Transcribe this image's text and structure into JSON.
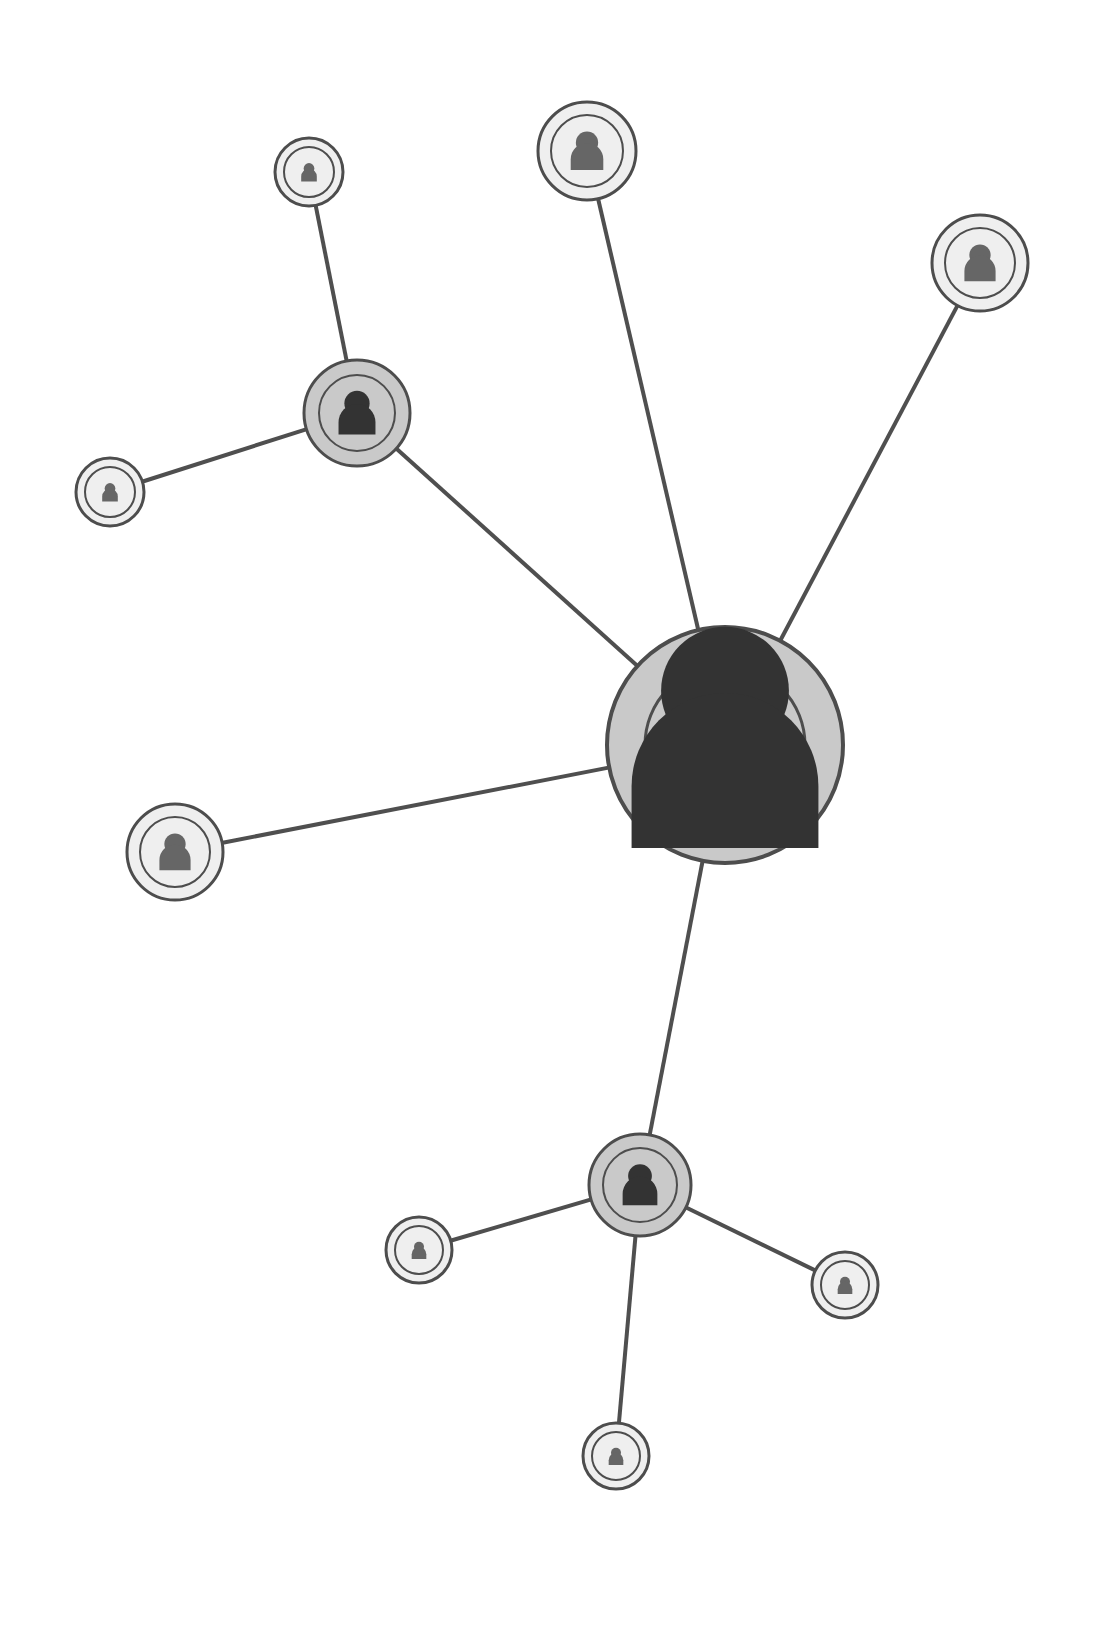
{
  "diagram": {
    "type": "node-link-network",
    "background_color": "#ffffff",
    "canvas": {
      "width": 1119,
      "height": 1627
    },
    "node_icon_name": "person-avatar-icon",
    "styles": {
      "hub_fill": "#c9c9c9",
      "hub_icon_color": "#333333",
      "leaf_fill": "#efefef",
      "leaf_icon_color": "#666666",
      "node_stroke": "#4d4d4d",
      "inner_ring_stroke": "#4d4d4d",
      "edge_color": "#4f4f4f",
      "edge_width": 4
    },
    "counts": {
      "total_nodes": 11,
      "total_edges": 10,
      "hub_nodes": 3,
      "leaf_nodes": 8
    },
    "nodes": [
      {
        "id": "center-hub",
        "label": "Central User",
        "role": "primary-hub",
        "cx": 725,
        "cy": 745,
        "r_outer": 118,
        "r_inner": 80,
        "icon_scale": 1.0,
        "fill": "#c9c9c9",
        "icon_color": "#333333",
        "stroke": "#4d4d4d",
        "stroke_width": 4,
        "degree": 5
      },
      {
        "id": "upper-left-hub",
        "label": "Upper Left Group Leader",
        "role": "secondary-hub",
        "cx": 357,
        "cy": 413,
        "r_outer": 53,
        "r_inner": 38,
        "icon_scale": 0.44,
        "fill": "#c9c9c9",
        "icon_color": "#333333",
        "stroke": "#4d4d4d",
        "stroke_width": 3,
        "degree": 3
      },
      {
        "id": "bottom-hub",
        "label": "Lower Group Leader",
        "role": "secondary-hub",
        "cx": 640,
        "cy": 1185,
        "r_outer": 51,
        "r_inner": 37,
        "icon_scale": 0.43,
        "fill": "#c9c9c9",
        "icon_color": "#333333",
        "stroke": "#4d4d4d",
        "stroke_width": 3,
        "degree": 4
      },
      {
        "id": "top-center-node",
        "label": "Top Center Contact",
        "role": "leaf",
        "cx": 587,
        "cy": 151,
        "r_outer": 49,
        "r_inner": 36,
        "icon_scale": 0.42,
        "fill": "#efefef",
        "icon_color": "#666666",
        "stroke": "#4d4d4d",
        "stroke_width": 3,
        "degree": 1
      },
      {
        "id": "top-right-node",
        "label": "Top Right Contact",
        "role": "leaf",
        "cx": 980,
        "cy": 263,
        "r_outer": 48,
        "r_inner": 35,
        "icon_scale": 0.41,
        "fill": "#efefef",
        "icon_color": "#666666",
        "stroke": "#4d4d4d",
        "stroke_width": 3,
        "degree": 1
      },
      {
        "id": "left-mid-node",
        "label": "Left Middle Contact",
        "role": "leaf",
        "cx": 175,
        "cy": 852,
        "r_outer": 48,
        "r_inner": 35,
        "icon_scale": 0.41,
        "fill": "#efefef",
        "icon_color": "#666666",
        "stroke": "#4d4d4d",
        "stroke_width": 3,
        "degree": 1
      },
      {
        "id": "small-top-left-node",
        "label": "Upper Left Small Contact",
        "role": "leaf",
        "cx": 309,
        "cy": 172,
        "r_outer": 34,
        "r_inner": 25,
        "icon_scale": 0.29,
        "fill": "#efefef",
        "icon_color": "#666666",
        "stroke": "#4d4d4d",
        "stroke_width": 3,
        "degree": 1
      },
      {
        "id": "small-far-left-node",
        "label": "Far Left Small Contact",
        "role": "leaf",
        "cx": 110,
        "cy": 492,
        "r_outer": 34,
        "r_inner": 25,
        "icon_scale": 0.29,
        "fill": "#efefef",
        "icon_color": "#666666",
        "stroke": "#4d4d4d",
        "stroke_width": 3,
        "degree": 1
      },
      {
        "id": "small-bottom-left-node",
        "label": "Lower Left Small Contact",
        "role": "leaf",
        "cx": 419,
        "cy": 1250,
        "r_outer": 33,
        "r_inner": 24,
        "icon_scale": 0.28,
        "fill": "#efefef",
        "icon_color": "#666666",
        "stroke": "#4d4d4d",
        "stroke_width": 3,
        "degree": 1
      },
      {
        "id": "small-bottom-right-node",
        "label": "Lower Right Small Contact",
        "role": "leaf",
        "cx": 845,
        "cy": 1285,
        "r_outer": 33,
        "r_inner": 24,
        "icon_scale": 0.28,
        "fill": "#efefef",
        "icon_color": "#666666",
        "stroke": "#4d4d4d",
        "stroke_width": 3,
        "degree": 1
      },
      {
        "id": "small-bottom-node",
        "label": "Bottom Small Contact",
        "role": "leaf",
        "cx": 616,
        "cy": 1456,
        "r_outer": 33,
        "r_inner": 24,
        "icon_scale": 0.28,
        "fill": "#efefef",
        "icon_color": "#666666",
        "stroke": "#4d4d4d",
        "stroke_width": 3,
        "degree": 1
      }
    ],
    "edges": [
      {
        "id": "edge-center-upperleft",
        "from": "center-hub",
        "to": "upper-left-hub",
        "x1": 725,
        "y1": 745,
        "x2": 357,
        "y2": 413
      },
      {
        "id": "edge-center-topcenter",
        "from": "center-hub",
        "to": "top-center-node",
        "x1": 725,
        "y1": 745,
        "x2": 587,
        "y2": 151
      },
      {
        "id": "edge-center-topright",
        "from": "center-hub",
        "to": "top-right-node",
        "x1": 725,
        "y1": 745,
        "x2": 980,
        "y2": 263
      },
      {
        "id": "edge-center-leftmid",
        "from": "center-hub",
        "to": "left-mid-node",
        "x1": 725,
        "y1": 745,
        "x2": 175,
        "y2": 852
      },
      {
        "id": "edge-center-bottomhub",
        "from": "center-hub",
        "to": "bottom-hub",
        "x1": 725,
        "y1": 745,
        "x2": 640,
        "y2": 1185
      },
      {
        "id": "edge-upperleft-smalltop",
        "from": "upper-left-hub",
        "to": "small-top-left-node",
        "x1": 357,
        "y1": 413,
        "x2": 309,
        "y2": 172
      },
      {
        "id": "edge-upperleft-farleft",
        "from": "upper-left-hub",
        "to": "small-far-left-node",
        "x1": 357,
        "y1": 413,
        "x2": 110,
        "y2": 492
      },
      {
        "id": "edge-bottomhub-bottomleft",
        "from": "bottom-hub",
        "to": "small-bottom-left-node",
        "x1": 640,
        "y1": 1185,
        "x2": 419,
        "y2": 1250
      },
      {
        "id": "edge-bottomhub-bottomright",
        "from": "bottom-hub",
        "to": "small-bottom-right-node",
        "x1": 640,
        "y1": 1185,
        "x2": 845,
        "y2": 1285
      },
      {
        "id": "edge-bottomhub-bottom",
        "from": "bottom-hub",
        "to": "small-bottom-node",
        "x1": 640,
        "y1": 1185,
        "x2": 616,
        "y2": 1456
      }
    ]
  }
}
